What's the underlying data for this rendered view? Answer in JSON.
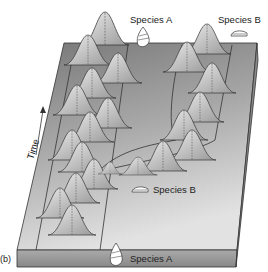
{
  "figure": {
    "panel_label": "(b)",
    "axis_label": "Time",
    "labels": {
      "top_species_a": "Species A",
      "top_species_b": "Species B",
      "mid_species_b": "Species B",
      "bottom_species_a": "Species A"
    },
    "colors": {
      "slab_top_far": "#7a7a7a",
      "slab_top_near": "#d8d8d8",
      "slab_front": "#9a9a9a",
      "curve_fill": "#c8c8c8",
      "line": "#333333"
    }
  }
}
